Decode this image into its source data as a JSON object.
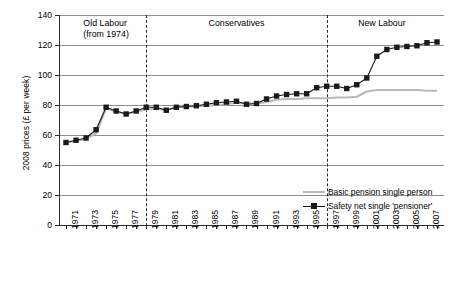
{
  "chart_data": {
    "type": "line",
    "title": "",
    "xlabel": "",
    "ylabel": "2008 prices (£ per week)",
    "xlim": [
      1971,
      2008
    ],
    "ylim": [
      0,
      140
    ],
    "ytick_values": [
      0,
      20,
      40,
      60,
      80,
      100,
      120,
      140
    ],
    "ytick_labels": [
      "0",
      "20",
      "40",
      "60",
      "80",
      "100",
      "120",
      "140"
    ],
    "grid": "horizontal",
    "legend_position": "inside-lower-right",
    "x": [
      1971,
      1972,
      1973,
      1974,
      1975,
      1976,
      1977,
      1978,
      1979,
      1980,
      1981,
      1982,
      1983,
      1984,
      1985,
      1986,
      1987,
      1988,
      1989,
      1990,
      1991,
      1992,
      1993,
      1994,
      1995,
      1996,
      1997,
      1998,
      1999,
      2000,
      2001,
      2002,
      2003,
      2004,
      2005,
      2006,
      2007,
      2008
    ],
    "xtick_labels": [
      "1971",
      "",
      "1973",
      "",
      "1975",
      "",
      "1977",
      "",
      "1979",
      "",
      "1981",
      "",
      "1983",
      "",
      "1985",
      "",
      "1987",
      "",
      "1989",
      "",
      "1991",
      "",
      "1993",
      "",
      "1995",
      "",
      "1997",
      "",
      "1999",
      "",
      "2001",
      "",
      "2003",
      "",
      "2005",
      "",
      "2007",
      ""
    ],
    "series": [
      {
        "name": "Basic pension single person",
        "color": "#b9b9b9",
        "marker": "none",
        "values": [
          55.0,
          56.0,
          57.5,
          61.0,
          78.0,
          75.5,
          74.0,
          75.5,
          77.0,
          77.5,
          76.5,
          78.5,
          79.0,
          79.0,
          79.5,
          80.0,
          80.5,
          81.5,
          81.0,
          81.0,
          82.0,
          83.5,
          84.0,
          84.0,
          84.5,
          84.5,
          84.5,
          85.0,
          85.0,
          85.5,
          89.0,
          90.0,
          90.0,
          90.0,
          90.0,
          90.0,
          89.5,
          89.5
        ]
      },
      {
        "name": "Safety net single 'pensioner'",
        "color": "#1a1a1a",
        "marker": "square",
        "values": [
          55.0,
          56.5,
          58.0,
          63.5,
          78.5,
          76.0,
          74.0,
          76.0,
          78.5,
          78.5,
          76.5,
          78.5,
          79.0,
          79.5,
          80.5,
          81.5,
          82.0,
          82.5,
          80.5,
          81.0,
          84.0,
          86.0,
          87.0,
          87.5,
          87.5,
          91.5,
          92.5,
          92.5,
          91.0,
          93.5,
          98.0,
          112.5,
          117.0,
          118.5,
          119.0,
          119.5,
          121.5,
          122.0
        ]
      }
    ],
    "eras": [
      {
        "label_line1": "Old Labour",
        "label_line2": "(from 1974)",
        "start": 1971,
        "end": 1979
      },
      {
        "label_line1": "Conservatives",
        "label_line2": "",
        "start": 1979,
        "end": 1997
      },
      {
        "label_line1": "New Labour",
        "label_line2": "",
        "start": 1997,
        "end": 2008
      }
    ],
    "dividers": [
      1979,
      1997
    ]
  },
  "legend": {
    "items": [
      {
        "label": "Basic pension single person"
      },
      {
        "label": "Safety net single 'pensioner'"
      }
    ]
  }
}
